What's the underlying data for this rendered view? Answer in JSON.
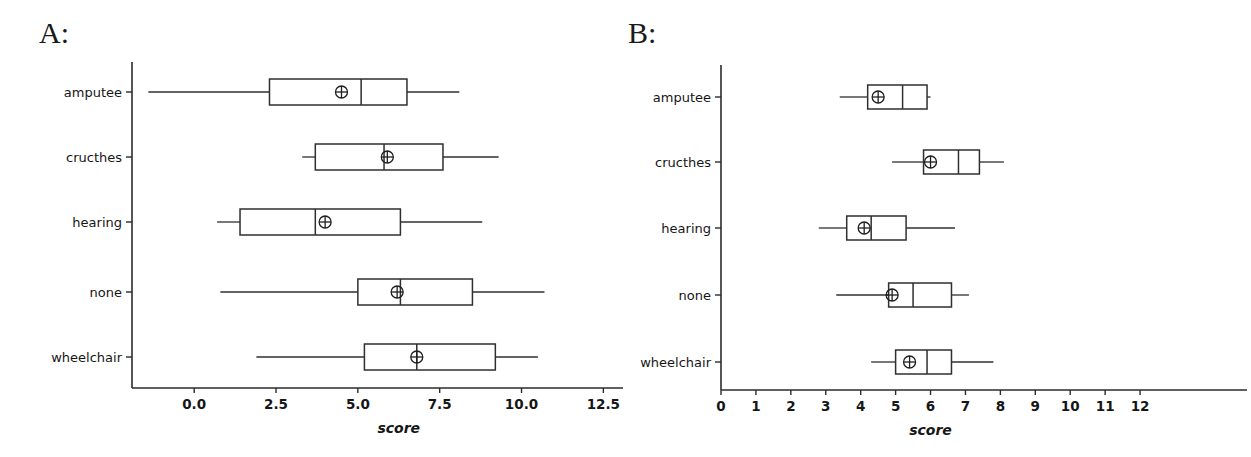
{
  "figure": {
    "panels": [
      {
        "id": "A",
        "letter": "A:"
      },
      {
        "id": "B",
        "letter": "B:"
      }
    ]
  },
  "chart_data": [
    {
      "type": "box",
      "panel_label": "A:",
      "title": "",
      "xlabel": "score",
      "ylabel": "",
      "orientation": "horizontal",
      "xlim": [
        -1.9,
        13.1
      ],
      "xticks": [
        0.0,
        2.5,
        5.0,
        7.5,
        10.0,
        12.5
      ],
      "xticklabels": [
        "0.0",
        "2.5",
        "5.0",
        "7.5",
        "10.0",
        "12.5"
      ],
      "grid": false,
      "legend": null,
      "categories": [
        "amputee",
        "cructhes",
        "hearing",
        "none",
        "wheelchair"
      ],
      "boxes": [
        {
          "category": "amputee",
          "whisker_low": -1.4,
          "q1": 2.3,
          "median": 5.1,
          "q3": 6.5,
          "whisker_high": 8.1,
          "mean": 4.5
        },
        {
          "category": "cructhes",
          "whisker_low": 3.3,
          "q1": 3.7,
          "median": 5.8,
          "q3": 7.6,
          "whisker_high": 9.3,
          "mean": 5.9
        },
        {
          "category": "hearing",
          "whisker_low": 0.7,
          "q1": 1.4,
          "median": 3.7,
          "q3": 6.3,
          "whisker_high": 8.8,
          "mean": 4.0
        },
        {
          "category": "none",
          "whisker_low": 0.8,
          "q1": 5.0,
          "median": 6.3,
          "q3": 8.5,
          "whisker_high": 10.7,
          "mean": 6.2
        },
        {
          "category": "wheelchair",
          "whisker_low": 1.9,
          "q1": 5.2,
          "median": 6.8,
          "q3": 9.2,
          "whisker_high": 10.5,
          "mean": 6.8
        }
      ]
    },
    {
      "type": "box",
      "panel_label": "B:",
      "title": "",
      "xlabel": "score",
      "ylabel": "",
      "orientation": "horizontal",
      "xlim": [
        0,
        12.8
      ],
      "xticks": [
        0,
        1,
        2,
        3,
        4,
        5,
        6,
        7,
        8,
        9,
        10,
        11,
        12
      ],
      "xticklabels": [
        "0",
        "1",
        "2",
        "3",
        "4",
        "5",
        "6",
        "7",
        "8",
        "9",
        "10",
        "11",
        "12"
      ],
      "grid": false,
      "legend": null,
      "categories": [
        "amputee",
        "cructhes",
        "hearing",
        "none",
        "wheelchair"
      ],
      "boxes": [
        {
          "category": "amputee",
          "whisker_low": 3.4,
          "q1": 4.2,
          "median": 5.2,
          "q3": 5.9,
          "whisker_high": 6.0,
          "mean": 4.5
        },
        {
          "category": "cructhes",
          "whisker_low": 4.9,
          "q1": 5.8,
          "median": 6.8,
          "q3": 7.4,
          "whisker_high": 8.1,
          "mean": 6.0
        },
        {
          "category": "hearing",
          "whisker_low": 2.8,
          "q1": 3.6,
          "median": 4.3,
          "q3": 5.3,
          "whisker_high": 6.7,
          "mean": 4.1
        },
        {
          "category": "none",
          "whisker_low": 3.3,
          "q1": 4.8,
          "median": 5.5,
          "q3": 6.6,
          "whisker_high": 7.1,
          "mean": 4.9
        },
        {
          "category": "wheelchair",
          "whisker_low": 4.3,
          "q1": 5.0,
          "median": 5.9,
          "q3": 6.6,
          "whisker_high": 7.8,
          "mean": 5.4
        }
      ]
    }
  ]
}
